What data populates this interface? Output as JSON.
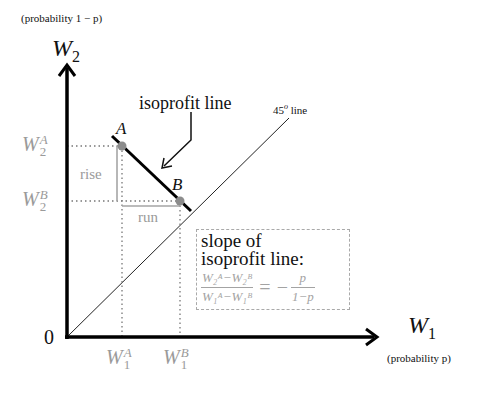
{
  "diagram": {
    "y_axis": {
      "name": "W",
      "subscript": "2",
      "note": "(probability 1 − p)"
    },
    "x_axis": {
      "name": "W",
      "subscript": "1",
      "note": "(probability p)"
    },
    "origin_label": "0",
    "points": [
      {
        "id": "A",
        "label": "A",
        "x": 122,
        "y": 146
      },
      {
        "id": "B",
        "label": "B",
        "x": 180,
        "y": 201
      }
    ],
    "y_ticks": [
      {
        "base": "W",
        "sup": "A",
        "sub": "2"
      },
      {
        "base": "W",
        "sup": "B",
        "sub": "2"
      }
    ],
    "x_ticks": [
      {
        "base": "W",
        "sup": "A",
        "sub": "1"
      },
      {
        "base": "W",
        "sup": "B",
        "sub": "1"
      }
    ],
    "rise_label": "rise",
    "run_label": "run",
    "isoprofit_label": "isoprofit line",
    "line45_label": "45",
    "line45_degree": "o",
    "line45_suffix": " line",
    "slope_box": {
      "title_line1": "slope of",
      "title_line2": "isoprofit line:",
      "lhs_num": "W₂ᴬ−W₂ᴮ",
      "lhs_den": "W₁ᴬ−W₁ᴮ",
      "equals": "=",
      "minus": "−",
      "rhs_num": "p",
      "rhs_den": "1−p"
    },
    "colors": {
      "axis": "#000000",
      "isoprofit_line": "#000000",
      "points": "#8c8c8c",
      "guides": "#a0a0a0",
      "gray_text": "#9a9a9a"
    }
  }
}
